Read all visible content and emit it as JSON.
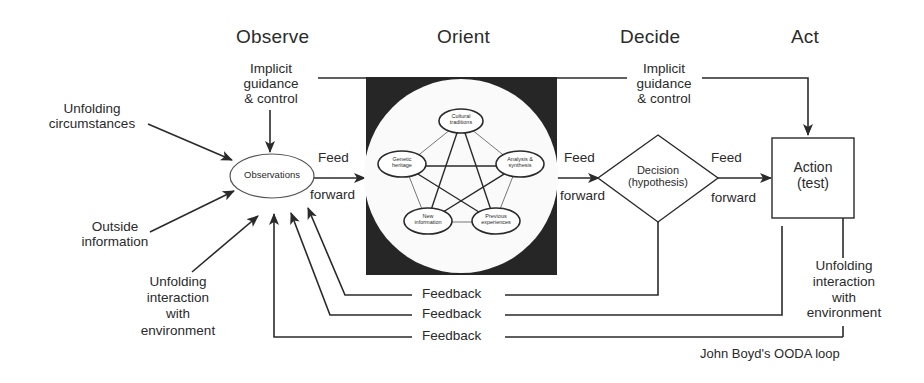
{
  "title": "John Boyd's OODA loop",
  "phases": {
    "observe": "Observe",
    "orient": "Orient",
    "decide": "Decide",
    "act": "Act"
  },
  "observe": {
    "inputs": {
      "unfolding_circumstances": [
        "Unfolding",
        "circumstances"
      ],
      "outside_information": [
        "Outside",
        "information"
      ],
      "unfolding_interaction": [
        "Unfolding",
        "interaction",
        "with",
        "environment"
      ]
    },
    "implicit_guidance": [
      "Implicit",
      "guidance",
      "& control"
    ],
    "observations": "Observations"
  },
  "orient": {
    "nodes": [
      {
        "id": "cultural",
        "lines": [
          "Cultural",
          "traditions"
        ]
      },
      {
        "id": "genetic",
        "lines": [
          "Genetic",
          "heritage"
        ]
      },
      {
        "id": "analysis",
        "lines": [
          "Analysis &",
          "synthesis"
        ]
      },
      {
        "id": "new_info",
        "lines": [
          "New",
          "information"
        ]
      },
      {
        "id": "previous",
        "lines": [
          "Previous",
          "experiences"
        ]
      }
    ]
  },
  "decide": {
    "implicit_guidance": [
      "Implicit",
      "guidance",
      "& control"
    ],
    "decision": [
      "Decision",
      "(hypothesis)"
    ]
  },
  "act": {
    "action": [
      "Action",
      "(test)"
    ],
    "unfolding_interaction": [
      "Unfolding",
      "interaction",
      "with",
      "environment"
    ]
  },
  "connectors": {
    "feed": "Feed",
    "forward": "forward",
    "feedback": "Feedback"
  },
  "colors": {
    "ink": "#2a2a2a",
    "orient_box": "#262626",
    "background": "#ffffff"
  }
}
